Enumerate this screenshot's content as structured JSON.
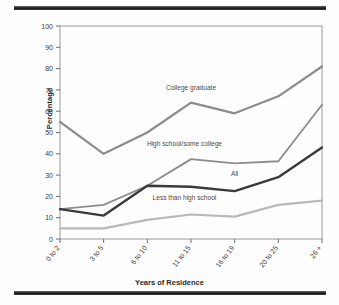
{
  "figure": {
    "name": "line-chart-years-of-residence",
    "frame_color": "#9a9a9a",
    "rule_color": "#1d1d1d",
    "background": "#fdfdfd"
  },
  "chart_data": {
    "type": "line",
    "title": "",
    "subtitle": "",
    "xlabel": "Years of Residence",
    "ylabel": "Percentage",
    "categories": [
      "0 to 2",
      "3 to 5",
      "6 to 10",
      "11 to 15",
      "16 to 19",
      "20 to 25",
      "26 +"
    ],
    "ylim": [
      0,
      100
    ],
    "yticks": [
      0,
      10,
      20,
      30,
      40,
      50,
      60,
      70,
      80,
      90,
      100
    ],
    "grid": false,
    "legend_position": "inline-labels",
    "series": [
      {
        "name": "College graduate",
        "color": "#8c8c8c",
        "width": 2.2,
        "values": [
          55,
          40,
          50,
          64,
          59,
          67,
          81
        ],
        "label_x_index": 3.0,
        "label_y": 70
      },
      {
        "name": "High school/some college",
        "color": "#8c8c8c",
        "width": 1.8,
        "values": [
          14,
          16,
          25,
          37.5,
          35.5,
          36.5,
          63
        ],
        "label_x_index": 2.85,
        "label_y": 43.5
      },
      {
        "name": "All",
        "color": "#3a3a3a",
        "width": 2.4,
        "values": [
          14,
          11,
          25,
          24.5,
          22.5,
          29,
          43
        ],
        "label_x_index": 4.0,
        "label_y": 29.5
      },
      {
        "name": "Less than high school",
        "color": "#b9b9b9",
        "width": 2.2,
        "values": [
          5,
          5,
          9,
          11.5,
          10.5,
          16,
          18
        ],
        "label_x_index": 2.85,
        "label_y": 18.5
      }
    ]
  }
}
